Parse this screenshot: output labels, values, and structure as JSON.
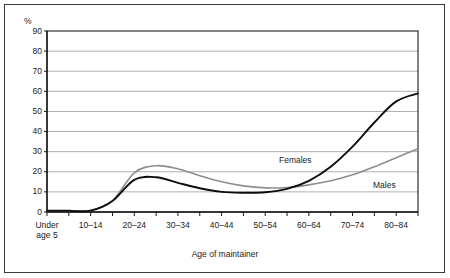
{
  "figure": {
    "percent_symbol": "%",
    "x_axis_title": "Age of maintainer"
  },
  "series_labels": {
    "females": "Females",
    "males": "Males"
  },
  "colors": {
    "females_line": "#0d0d0d",
    "males_line": "#8e8e8e",
    "gridline": "#9a9a9a",
    "axis": "#1b1b1b",
    "frame": "#3a3a3a",
    "background": "#ffffff"
  },
  "chart_data": {
    "type": "line",
    "title": "",
    "subtitle": "",
    "xlabel": "Age of maintainer",
    "ylabel": "%",
    "ylim": [
      0,
      90
    ],
    "yticks": [
      0,
      10,
      20,
      30,
      40,
      50,
      60,
      70,
      80,
      90
    ],
    "ytick_labels": [
      "0",
      "10",
      "20",
      "30",
      "40",
      "50",
      "60",
      "70",
      "80",
      "90"
    ],
    "grid": "horizontal",
    "legend_position": "inline-annotation",
    "categories": [
      "Under age 5",
      "5-9",
      "10-14",
      "15-19",
      "20-24",
      "25-29",
      "30-34",
      "35-39",
      "40-44",
      "45-49",
      "50-54",
      "55-59",
      "60-64",
      "65-69",
      "70-74",
      "75-79",
      "80-84",
      "85+"
    ],
    "xtick_labels": [
      "Under\nage 5",
      "",
      "10–14",
      "",
      "20–24",
      "",
      "30–34",
      "",
      "40–44",
      "",
      "50–54",
      "",
      "60–64",
      "",
      "70–74",
      "",
      "80–84",
      ""
    ],
    "xtick_labels_visible": [
      "Under age 5",
      "10–14",
      "20–24",
      "30–34",
      "40–44",
      "50–54",
      "60–64",
      "70–74",
      "80–84"
    ],
    "series": [
      {
        "name": "Females",
        "color": "#0d0d0d",
        "values": [
          0.6,
          0.6,
          0.7,
          5.5,
          16.0,
          17.3,
          14.5,
          11.8,
          10.0,
          9.6,
          9.8,
          11.5,
          15.5,
          22.5,
          32.5,
          44.5,
          55.0,
          59.0
        ]
      },
      {
        "name": "Males",
        "color": "#8e8e8e",
        "values": [
          0.6,
          0.6,
          0.7,
          5.5,
          19.5,
          23.0,
          21.5,
          18.0,
          15.0,
          13.0,
          12.0,
          12.2,
          13.5,
          15.5,
          18.5,
          22.5,
          27.0,
          31.5
        ]
      }
    ],
    "annotations": [
      {
        "text": "Females",
        "near_category": "45-49",
        "value": 30
      },
      {
        "text": "Males",
        "near_category": "75-79",
        "value": 18
      }
    ]
  }
}
